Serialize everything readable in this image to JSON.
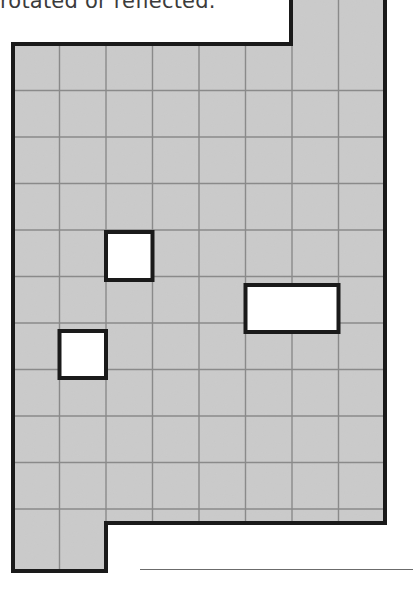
{
  "caption": {
    "text": "rotated or reflected.",
    "color": "#3b3b3b"
  },
  "figure": {
    "name": "grid-polyomino-with-holes",
    "cell_size": 46.5,
    "origin_x": 13,
    "origin_y": 44,
    "columns": 8,
    "rows": 11,
    "fill_color": "#d2d2d2",
    "grid_line_color": "#8a8a8a",
    "outline_color": "#1a1a1a",
    "hole_fill_color": "#ffffff",
    "outline_width": 4,
    "grid_line_width": 1.4,
    "outline_path": "M 291 -10 L 385 -10 L 385 523 L 106 523 L 106 571 L 13 571 L 13 44 L 291 44 Z",
    "grid_vertical_x": [
      59.5,
      106,
      152.5,
      199,
      245.5,
      292,
      338.5
    ],
    "grid_horizontal_y": [
      90.5,
      137,
      183.5,
      230,
      276.5,
      323,
      369.5,
      416,
      462.5,
      509
    ],
    "top_notch": {
      "label": "top-right-extension",
      "from_x": 291,
      "to_x": 385,
      "cut_at_y": 44
    },
    "bottom_tab": {
      "label": "bottom-left-extension",
      "from_x": 13,
      "to_x": 106,
      "from_y": 523,
      "to_y": 571
    },
    "holes": [
      {
        "name": "hole-small-upper",
        "x": 106,
        "y": 232,
        "width": 46.5,
        "height": 48
      },
      {
        "name": "hole-wide-middle",
        "x": 245.5,
        "y": 285,
        "width": 93,
        "height": 47
      },
      {
        "name": "hole-small-lower",
        "x": 59.5,
        "y": 331,
        "width": 46.5,
        "height": 47
      }
    ]
  },
  "rule": {
    "name": "bottom-horizontal-rule",
    "x": 140,
    "y": 569,
    "width": 273,
    "color": "#6b6b6b"
  }
}
